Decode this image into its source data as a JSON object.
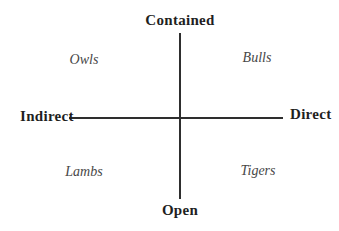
{
  "diagram": {
    "type": "quadrant",
    "axes": {
      "top": "Contained",
      "bottom": "Open",
      "left": "Indirect",
      "right": "Direct"
    },
    "quadrants": {
      "top_left": "Owls",
      "top_right": "Bulls",
      "bottom_left": "Lambs",
      "bottom_right": "Tigers"
    },
    "colors": {
      "background": "#ffffff",
      "line": "#2e2e2e",
      "axis_label": "#1f1f1f",
      "quadrant_label": "#474747"
    }
  }
}
